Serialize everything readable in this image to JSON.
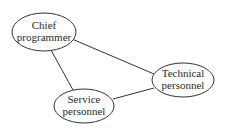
{
  "diagram": {
    "nodes": [
      {
        "id": "chief",
        "lines": [
          "Chief",
          "programmer"
        ],
        "cx": 44,
        "cy": 32,
        "rx": 32,
        "ry": 19
      },
      {
        "id": "technical",
        "lines": [
          "Technical",
          "personnel"
        ],
        "cx": 183,
        "cy": 80,
        "rx": 31,
        "ry": 17
      },
      {
        "id": "service",
        "lines": [
          "Service",
          "personnel"
        ],
        "cx": 84,
        "cy": 106,
        "rx": 30,
        "ry": 17
      }
    ],
    "edges": [
      {
        "from": "chief",
        "to": "technical"
      },
      {
        "from": "chief",
        "to": "service"
      },
      {
        "from": "service",
        "to": "technical"
      }
    ],
    "colors": {
      "stroke": "#333333",
      "text": "#2a2a2a",
      "background": "#ffffff"
    }
  }
}
